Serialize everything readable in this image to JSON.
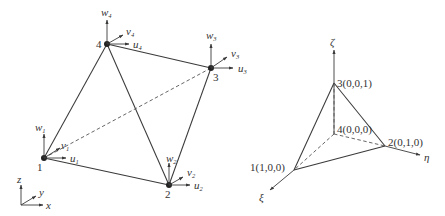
{
  "left_figure": {
    "title": "Tetrahedral element in global coordinates",
    "nodes": [
      {
        "id": "1",
        "label": "1",
        "dofs": {
          "u": "u",
          "u_sub": "1",
          "v": "v",
          "v_sub": "1",
          "w": "w",
          "w_sub": "1"
        }
      },
      {
        "id": "2",
        "label": "2",
        "dofs": {
          "u": "u",
          "u_sub": "2",
          "v": "v",
          "v_sub": "2",
          "w": "w",
          "w_sub": "2"
        }
      },
      {
        "id": "3",
        "label": "3",
        "dofs": {
          "u": "u",
          "u_sub": "3",
          "v": "v",
          "v_sub": "3",
          "w": "w",
          "w_sub": "3"
        }
      },
      {
        "id": "4",
        "label": "4",
        "dofs": {
          "u": "u",
          "u_sub": "4",
          "v": "v",
          "v_sub": "4",
          "w": "w",
          "w_sub": "4"
        }
      }
    ],
    "axes": {
      "x": "x",
      "y": "y",
      "z": "z"
    },
    "edges": [
      {
        "from": "1",
        "to": "2",
        "style": "solid"
      },
      {
        "from": "1",
        "to": "4",
        "style": "solid"
      },
      {
        "from": "2",
        "to": "3",
        "style": "solid"
      },
      {
        "from": "2",
        "to": "4",
        "style": "solid"
      },
      {
        "from": "3",
        "to": "4",
        "style": "solid"
      },
      {
        "from": "1",
        "to": "3",
        "style": "dashed"
      }
    ]
  },
  "right_figure": {
    "title": "Reference (natural) tetrahedron",
    "nodes": [
      {
        "id": "1",
        "label": "1(1,0,0)"
      },
      {
        "id": "2",
        "label": "2(0,1,0)"
      },
      {
        "id": "3",
        "label": "3(0,0,1)"
      },
      {
        "id": "4",
        "label": "4(0,0,0)"
      }
    ],
    "axes": {
      "xi": "ξ",
      "eta": "η",
      "zeta": "ζ"
    },
    "edges": [
      {
        "from": "1",
        "to": "2",
        "style": "solid"
      },
      {
        "from": "1",
        "to": "3",
        "style": "solid"
      },
      {
        "from": "2",
        "to": "3",
        "style": "solid"
      },
      {
        "from": "1",
        "to": "4",
        "style": "dashed"
      },
      {
        "from": "2",
        "to": "4",
        "style": "dashed"
      },
      {
        "from": "3",
        "to": "4",
        "style": "dashed"
      }
    ]
  }
}
